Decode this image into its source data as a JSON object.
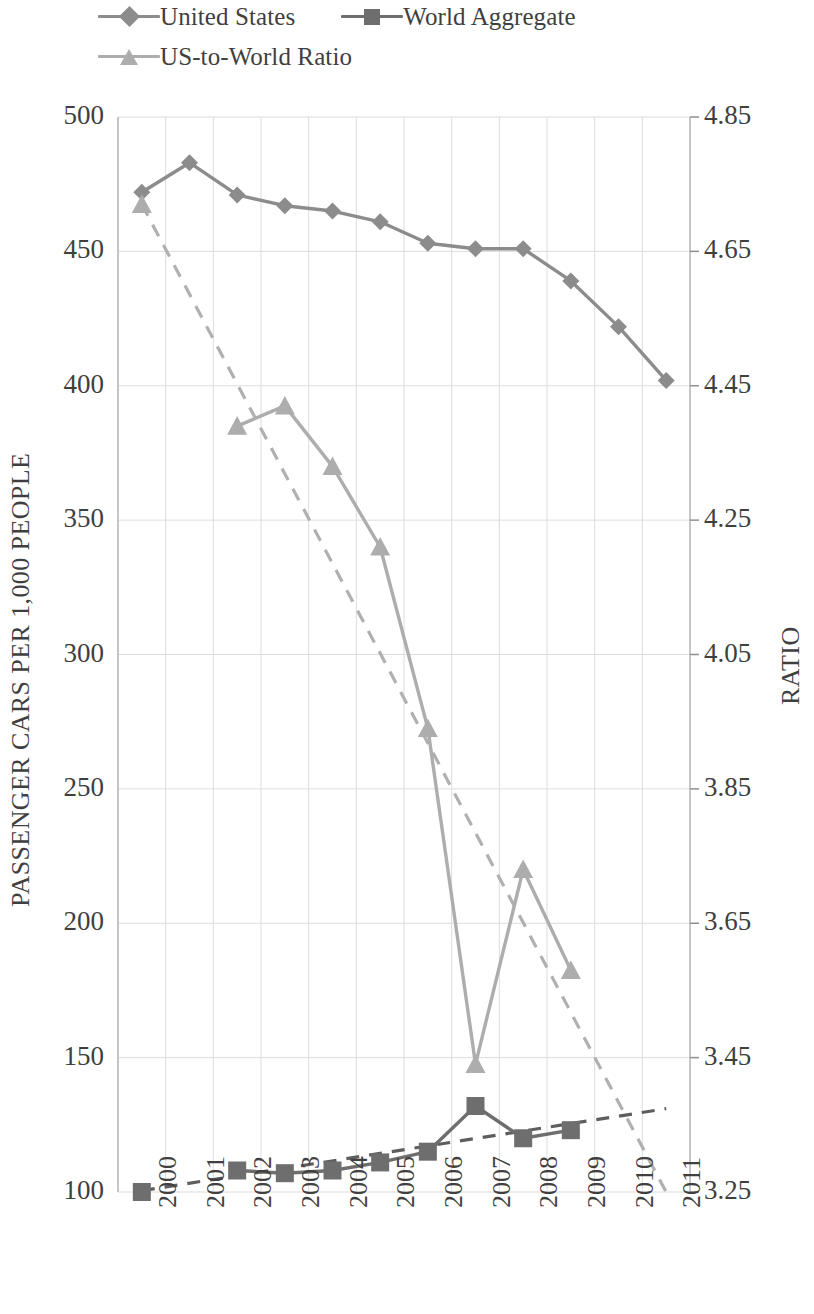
{
  "legend": {
    "items": [
      {
        "label": "United States",
        "marker": "diamond-marker",
        "color": "#8c8c8c"
      },
      {
        "label": "World Aggregate",
        "marker": "square-marker",
        "color": "#6e6e6e"
      },
      {
        "label": "US-to-World Ratio",
        "marker": "triangle-marker",
        "color": "#adadad"
      }
    ]
  },
  "axes": {
    "left_title": "PASSENGER CARS PER 1,000 PEOPLE",
    "right_title": "RATIO",
    "left_ticks": [
      "500",
      "450",
      "400",
      "350",
      "300",
      "250",
      "200",
      "150",
      "100"
    ],
    "right_ticks": [
      "4.85",
      "4.65",
      "4.45",
      "4.25",
      "4.05",
      "3.85",
      "3.65",
      "3.45",
      "3.25"
    ],
    "x_ticks": [
      "2000",
      "2001",
      "2002",
      "2003",
      "2004",
      "2005",
      "2006",
      "2007",
      "2008",
      "2009",
      "2010",
      "2011"
    ]
  },
  "colors": {
    "united_states": "#8c8c8c",
    "world_aggregate": "#6e6e6e",
    "ratio": "#adadad",
    "gridline": "#dcdcdc",
    "trend_us_ratio": "#b0b0b0",
    "trend_world": "#5e5e5e",
    "text": "#3f3f3f"
  },
  "chart_data": {
    "type": "line",
    "title": "",
    "xlabel": "",
    "ylabel": "PASSENGER CARS PER 1,000 PEOPLE",
    "y2label": "RATIO",
    "categories": [
      "2000",
      "2001",
      "2002",
      "2003",
      "2004",
      "2005",
      "2006",
      "2007",
      "2008",
      "2009",
      "2010",
      "2011"
    ],
    "ylim": [
      100,
      500
    ],
    "y2lim": [
      3.25,
      4.85
    ],
    "ytick_step": 50,
    "y2tick_step": 0.2,
    "grid": true,
    "legend_position": "top-left",
    "series": [
      {
        "name": "United States",
        "axis": "left",
        "marker": "diamond",
        "color": "#8c8c8c",
        "values": [
          472,
          483,
          471,
          467,
          465,
          461,
          453,
          451,
          451,
          439,
          422,
          402
        ]
      },
      {
        "name": "World Aggregate",
        "axis": "left",
        "marker": "square",
        "color": "#6e6e6e",
        "values": [
          100,
          null,
          108,
          107,
          108,
          111,
          115,
          132,
          120,
          123,
          null,
          null
        ]
      },
      {
        "name": "US-to-World Ratio",
        "axis": "right",
        "marker": "triangle",
        "color": "#adadad",
        "values": [
          4.72,
          null,
          4.39,
          4.42,
          4.33,
          4.21,
          3.94,
          3.44,
          3.73,
          3.58,
          null,
          null
        ]
      }
    ],
    "trendlines": [
      {
        "name": "US-to-World Ratio trend",
        "axis": "right",
        "style": "dashed",
        "color": "#b0b0b0",
        "x_start": "2000",
        "y_start": 4.72,
        "x_end": "2011",
        "y_end": 3.25
      },
      {
        "name": "World Aggregate trend",
        "axis": "left",
        "style": "dashed",
        "color": "#5e5e5e",
        "x_start": "2000",
        "y_start": 100.5,
        "x_end": "2011",
        "y_end": 131
      }
    ]
  }
}
